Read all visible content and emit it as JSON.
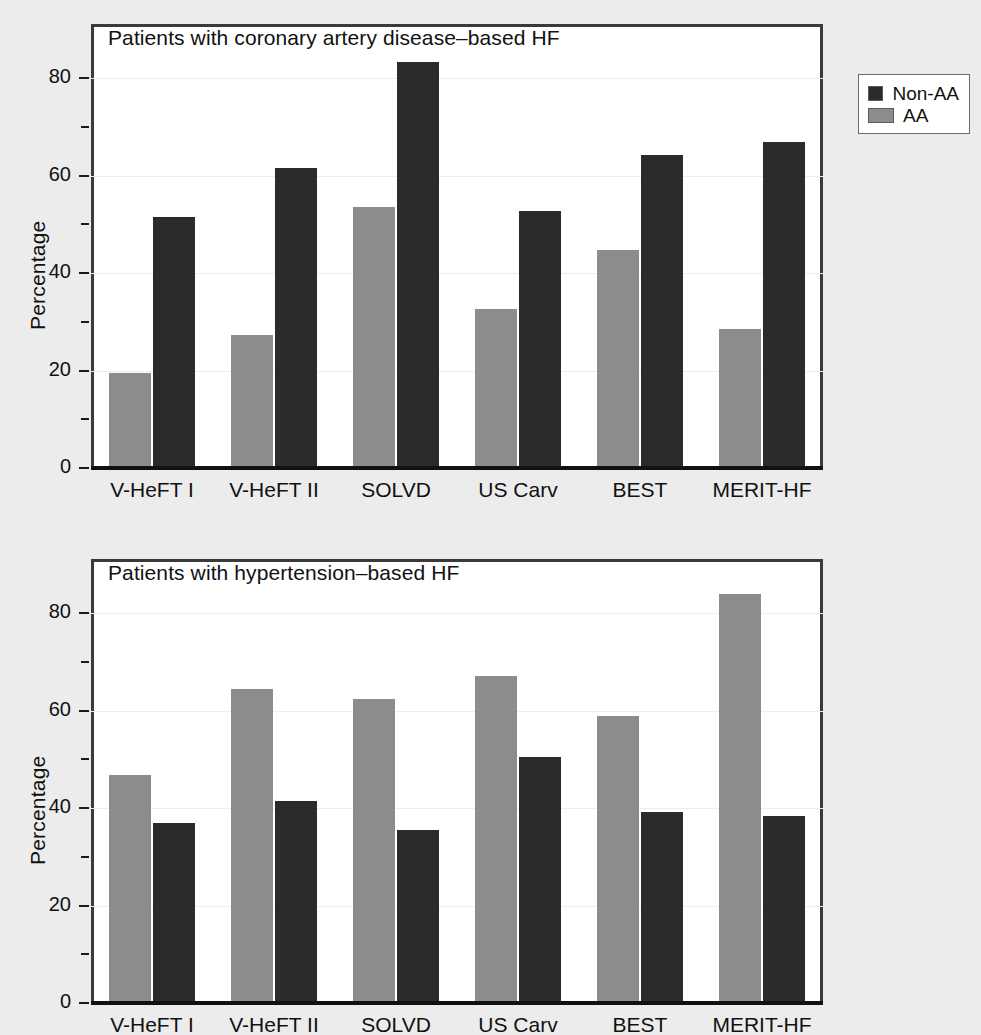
{
  "figure": {
    "background": "#ececed",
    "bar_colors": {
      "non_aa": "#2b2b2b",
      "aa": "#8c8c8c"
    }
  },
  "legend": {
    "position": "top-right",
    "items": [
      {
        "label": "Non-AA",
        "color": "#2b2b2b"
      },
      {
        "label": "AA",
        "color": "#8c8c8c"
      }
    ]
  },
  "panels": [
    {
      "id": "coronary",
      "title": "Patients with coronary artery disease–based HF",
      "ylabel": "Percentage"
    },
    {
      "id": "hypertension",
      "title": "Patients with hypertension–based HF",
      "ylabel": "Percentage"
    }
  ],
  "axis": {
    "y_major_labels": [
      "0",
      "20",
      "40",
      "60",
      "80"
    ],
    "y_major_values": [
      0,
      20,
      40,
      60,
      80
    ],
    "y_minor_values": [
      10,
      30,
      50,
      70
    ],
    "x_categories": [
      "V-HeFT I",
      "V-HeFT II",
      "SOLVD",
      "US Carv",
      "BEST",
      "MERIT-HF"
    ]
  },
  "chart_data": [
    {
      "type": "bar",
      "title": "Patients with coronary artery disease–based HF",
      "xlabel": "",
      "ylabel": "Percentage",
      "ylim": [
        0,
        88
      ],
      "yticks": [
        0,
        20,
        40,
        60,
        80
      ],
      "yminorticks": [
        10,
        30,
        50,
        70
      ],
      "grid": true,
      "legend_position": "outside top-right",
      "categories": [
        "V-HeFT I",
        "V-HeFT II",
        "SOLVD",
        "US Carv",
        "BEST",
        "MERIT-HF"
      ],
      "series": [
        {
          "name": "AA",
          "color": "#8c8c8c",
          "values": [
            19.4,
            27.3,
            53.5,
            32.6,
            44.7,
            28.5
          ]
        },
        {
          "name": "Non-AA",
          "color": "#2b2b2b",
          "values": [
            51.4,
            61.5,
            83.2,
            52.8,
            64.3,
            66.8
          ]
        }
      ],
      "series_draw_order": [
        "AA",
        "Non-AA"
      ]
    },
    {
      "type": "bar",
      "title": "Patients with hypertension–based HF",
      "xlabel": "",
      "ylabel": "Percentage",
      "ylim": [
        0,
        88
      ],
      "yticks": [
        0,
        20,
        40,
        60,
        80
      ],
      "yminorticks": [
        10,
        30,
        50,
        70
      ],
      "grid": true,
      "legend_position": "outside top-right",
      "categories": [
        "V-HeFT I",
        "V-HeFT II",
        "SOLVD",
        "US Carv",
        "BEST",
        "MERIT-HF"
      ],
      "series": [
        {
          "name": "AA",
          "color": "#8c8c8c",
          "values": [
            46.7,
            64.5,
            62.3,
            67.1,
            58.8,
            84.0
          ]
        },
        {
          "name": "Non-AA",
          "color": "#2b2b2b",
          "values": [
            37.0,
            41.4,
            35.5,
            50.4,
            39.1,
            38.3
          ]
        }
      ],
      "series_draw_order": [
        "AA",
        "Non-AA"
      ]
    }
  ]
}
